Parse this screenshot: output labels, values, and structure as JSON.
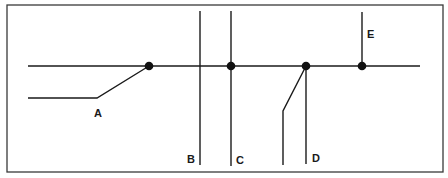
{
  "diagram": {
    "labels": {
      "a": "A",
      "b": "B",
      "c": "C",
      "d": "D",
      "e": "E"
    },
    "branches": [
      {
        "id": "A",
        "connected_to_main": true,
        "shape": "angled-from-left"
      },
      {
        "id": "B",
        "connected_to_main": false,
        "shape": "vertical-crossing"
      },
      {
        "id": "C",
        "connected_to_main": true,
        "shape": "vertical-crossing"
      },
      {
        "id": "D",
        "connected_to_main": true,
        "shape": "vertical-down-with-angled-branch"
      },
      {
        "id": "E",
        "connected_to_main": true,
        "shape": "vertical-up"
      }
    ],
    "junction_count": 4,
    "colors": {
      "line": "#1a1a1a",
      "junction": "#111111",
      "background": "#ffffff"
    }
  }
}
